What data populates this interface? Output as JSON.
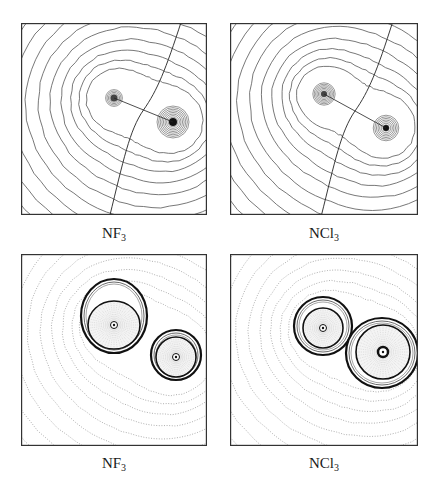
{
  "figure": {
    "panels": [
      {
        "id": "nf3-density",
        "label": "NF",
        "subscript": "3",
        "type": "electron-density-contours",
        "box": {
          "x": 21,
          "y": 23,
          "w": 186,
          "h": 192
        },
        "nuclei": [
          {
            "x": 93,
            "y": 75,
            "r": 3.5
          },
          {
            "x": 152,
            "y": 99,
            "r": 4
          }
        ],
        "inner_rings_a": 6,
        "inner_rings_b": 10,
        "outer_rings": 12
      },
      {
        "id": "ncl3-density",
        "label": "NCl",
        "subscript": "3",
        "type": "electron-density-contours",
        "box": {
          "x": 230,
          "y": 23,
          "w": 188,
          "h": 192
        },
        "nuclei": [
          {
            "x": 94,
            "y": 71,
            "r": 3
          },
          {
            "x": 156,
            "y": 105,
            "r": 3
          }
        ],
        "inner_rings_a": 8,
        "inner_rings_b": 8,
        "outer_rings": 13
      },
      {
        "id": "nf3-laplacian",
        "label": "NF",
        "subscript": "3",
        "type": "laplacian-contours",
        "box": {
          "x": 21,
          "y": 254,
          "w": 186,
          "h": 192
        },
        "nuclei": [
          {
            "x": 93,
            "y": 71,
            "rx": 26,
            "ry": 24
          },
          {
            "x": 155,
            "y": 103,
            "rx": 20,
            "ry": 20
          }
        ],
        "shells": [
          {
            "x": 93,
            "y": 62,
            "rx": 33,
            "ry": 37
          },
          {
            "x": 155,
            "y": 101,
            "rx": 25,
            "ry": 25
          }
        ]
      },
      {
        "id": "ncl3-laplacian",
        "label": "NCl",
        "subscript": "3",
        "type": "laplacian-contours",
        "box": {
          "x": 230,
          "y": 254,
          "w": 188,
          "h": 192
        },
        "nuclei": [
          {
            "x": 93,
            "y": 74,
            "rx": 20,
            "ry": 20
          },
          {
            "x": 153,
            "y": 98,
            "rx": 27,
            "ry": 27
          }
        ],
        "shells": [
          {
            "x": 93,
            "y": 72,
            "rx": 29,
            "ry": 29
          },
          {
            "x": 152,
            "y": 99,
            "rx": 36,
            "ry": 35
          }
        ]
      }
    ],
    "captions": [
      {
        "text": "NF",
        "sub": "3",
        "x": 114,
        "y": 225
      },
      {
        "text": "NCl",
        "sub": "3",
        "x": 324,
        "y": 225
      },
      {
        "text": "NF",
        "sub": "3",
        "x": 114,
        "y": 455
      },
      {
        "text": "NCl",
        "sub": "3",
        "x": 324,
        "y": 455
      }
    ],
    "colors": {
      "contour": "#555555",
      "dotted": "#9a9a9a",
      "frame": "#333333",
      "bold": "#111111"
    }
  }
}
